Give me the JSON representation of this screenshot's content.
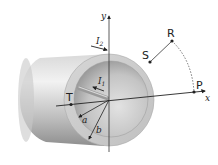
{
  "diagram": {
    "axes": {
      "x_label": "x",
      "y_label": "y"
    },
    "points": [
      {
        "id": "P",
        "label": "P"
      },
      {
        "id": "R",
        "label": "R"
      },
      {
        "id": "S",
        "label": "S"
      },
      {
        "id": "T",
        "label": "T"
      }
    ],
    "radii": [
      {
        "id": "a",
        "label": "a"
      },
      {
        "id": "b",
        "label": "b"
      }
    ],
    "currents": [
      {
        "id": "I1",
        "label": "I",
        "sub": "1"
      },
      {
        "id": "I2",
        "label": "I",
        "sub": "2"
      }
    ],
    "colors": {
      "tube_light": "#e6e6e6",
      "tube_dark": "#9c9c9c",
      "ring_face": "#cfcfcf",
      "inner_bore": "#b8b8b8",
      "line": "#222222"
    }
  }
}
